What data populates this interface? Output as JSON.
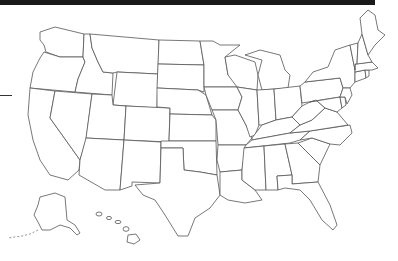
{
  "map": {
    "title": "United States blank outline map",
    "style": {
      "background": "#ffffff",
      "stroke": "#555555",
      "fill": "#ffffff",
      "topbar": "#1a1a1a"
    },
    "regions": [
      "Washington",
      "Oregon",
      "California",
      "Idaho",
      "Nevada",
      "Montana",
      "Wyoming",
      "Utah",
      "Arizona",
      "Colorado",
      "New Mexico",
      "North Dakota",
      "South Dakota",
      "Nebraska",
      "Kansas",
      "Oklahoma",
      "Texas",
      "Minnesota",
      "Iowa",
      "Missouri",
      "Arkansas",
      "Louisiana",
      "Wisconsin",
      "Illinois",
      "Michigan",
      "Indiana",
      "Ohio",
      "Kentucky",
      "Tennessee",
      "Mississippi",
      "Alabama",
      "Georgia",
      "Florida",
      "South Carolina",
      "North Carolina",
      "Virginia",
      "West Virginia",
      "Pennsylvania",
      "New York",
      "Maryland",
      "Delaware",
      "New Jersey",
      "Connecticut",
      "Rhode Island",
      "Massachusetts",
      "Vermont",
      "New Hampshire",
      "Maine",
      "Alaska",
      "Hawaii"
    ]
  }
}
